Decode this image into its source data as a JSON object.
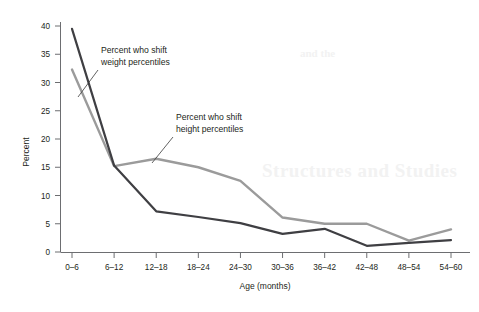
{
  "chart_data": {
    "type": "line",
    "title": "",
    "xlabel": "Age (months)",
    "ylabel": "Percent",
    "categories": [
      "0–6",
      "6–12",
      "12–18",
      "18–24",
      "24–30",
      "30–36",
      "36–42",
      "42–48",
      "48–54",
      "54–60"
    ],
    "series": [
      {
        "name": "Percent who shift weight percentiles",
        "color": "#3f3f43",
        "values": [
          39.5,
          15.3,
          7.2,
          6.2,
          5.1,
          3.2,
          4.1,
          1.1,
          1.6,
          2.1
        ]
      },
      {
        "name": "Percent who shift height percentiles",
        "color": "#9b9b9b",
        "values": [
          32.3,
          15.2,
          16.5,
          15.0,
          12.6,
          6.1,
          5.0,
          5.0,
          2.0,
          4.0
        ]
      }
    ],
    "ylim": [
      0,
      40
    ],
    "yticks": [
      0,
      5,
      10,
      15,
      20,
      25,
      30,
      35,
      40
    ],
    "ytick_labels": [
      "0",
      "5",
      "10",
      "15",
      "20",
      "25",
      "30",
      "35",
      "40"
    ],
    "grid": false,
    "legend": "inline-annotations"
  },
  "annotations": [
    {
      "id": "weight-annotation",
      "line1": "Percent who shift",
      "line2": "weight percentiles"
    },
    {
      "id": "height-annotation",
      "line1": "Percent who shift",
      "line2": "height percentiles"
    }
  ],
  "background_bleed": {
    "line_a": "Structures and Studies",
    "line_b": "and the"
  }
}
